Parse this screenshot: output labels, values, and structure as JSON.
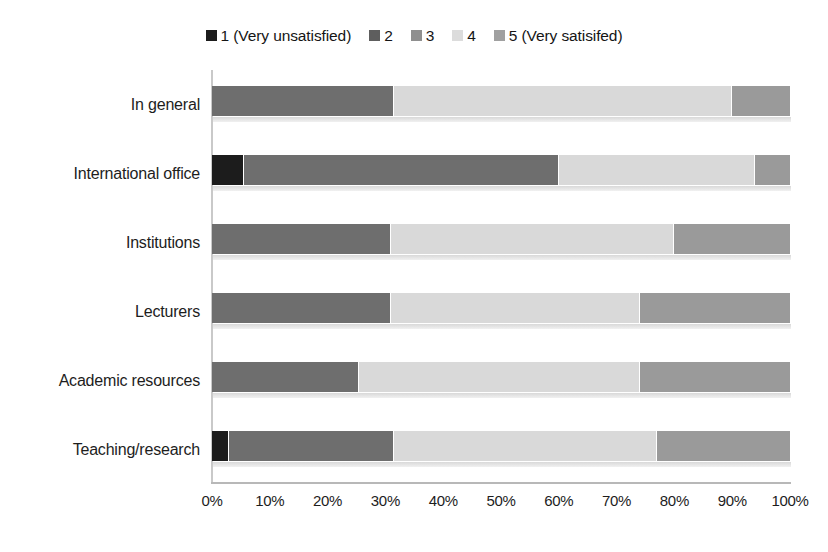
{
  "chart_data": {
    "type": "bar",
    "orientation": "horizontal",
    "stacked": true,
    "normalized_percent": true,
    "title": "",
    "subtitle": "",
    "xlabel": "",
    "ylabel": "",
    "xlim": [
      0,
      100
    ],
    "xticks": [
      "0%",
      "10%",
      "20%",
      "30%",
      "40%",
      "50%",
      "60%",
      "70%",
      "80%",
      "90%",
      "100%"
    ],
    "xtick_values": [
      0,
      10,
      20,
      30,
      40,
      50,
      60,
      70,
      80,
      90,
      100
    ],
    "grid": false,
    "legend_position": "top-center",
    "categories": [
      "In general",
      "International office",
      "Institutions",
      "Lecturers",
      "Academic resources",
      "Teaching/research"
    ],
    "series": [
      {
        "name": "1 (Very unsatisfied)",
        "color": "#1c1c1c",
        "values": [
          0,
          5.5,
          0,
          0,
          0,
          3
        ]
      },
      {
        "name": "2",
        "color": "#6e6e6e",
        "values": [
          31.5,
          54.5,
          31,
          31,
          25.5,
          28.5
        ]
      },
      {
        "name": "3",
        "color": "#8f8f8f",
        "values": [
          0,
          0,
          0,
          0,
          0,
          0
        ]
      },
      {
        "name": "4",
        "color": "#d9d9d9",
        "values": [
          58.5,
          34,
          49,
          43,
          48.5,
          45.5
        ]
      },
      {
        "name": "5 (Very satisifed)",
        "color": "#9a9a9a",
        "values": [
          10,
          6,
          20,
          26,
          26,
          23
        ]
      }
    ]
  },
  "legend": {
    "items": [
      {
        "label": "1 (Very unsatisfied)",
        "color": "#1c1c1c"
      },
      {
        "label": "2",
        "color": "#5e5e5e"
      },
      {
        "label": "3",
        "color": "#8f8f8f"
      },
      {
        "label": "4",
        "color": "#dcdcdc"
      },
      {
        "label": "5 (Very satisifed)",
        "color": "#a0a0a0"
      }
    ]
  }
}
